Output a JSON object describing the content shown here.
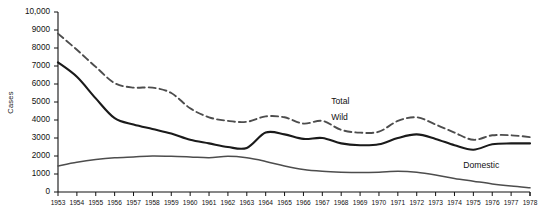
{
  "chart_data": {
    "type": "line",
    "title": "",
    "xlabel": "",
    "ylabel": "Cases",
    "xlim": [
      1953,
      1978
    ],
    "ylim": [
      0,
      10000
    ],
    "grid": false,
    "legend_position": "inline-annotations",
    "y_ticks": [
      "0",
      "1000",
      "2000",
      "3000",
      "4000",
      "5000",
      "6000",
      "7000",
      "8000",
      "9000",
      "10,000"
    ],
    "y_tick_values": [
      0,
      1000,
      2000,
      3000,
      4000,
      5000,
      6000,
      7000,
      8000,
      9000,
      10000
    ],
    "x": [
      1953,
      1954,
      1955,
      1956,
      1957,
      1958,
      1959,
      1960,
      1961,
      1962,
      1963,
      1964,
      1965,
      1966,
      1967,
      1968,
      1969,
      1970,
      1971,
      1972,
      1973,
      1974,
      1975,
      1976,
      1977,
      1978
    ],
    "x_tick_labels": [
      "1953",
      "1954",
      "1955",
      "1956",
      "1957",
      "1958",
      "1959",
      "1960",
      "1961",
      "1962",
      "1963",
      "1964",
      "1965",
      "1966",
      "1967",
      "1968",
      "1969",
      "1970",
      "1971",
      "1972",
      "1973",
      "1974",
      "1975",
      "1976",
      "1977",
      "1978"
    ],
    "series": [
      {
        "name": "Total",
        "style": "dashed",
        "color": "#4d4d4d",
        "values": [
          8800,
          7900,
          6950,
          6050,
          5800,
          5800,
          5500,
          4650,
          4150,
          3950,
          3900,
          4200,
          4150,
          3800,
          3950,
          3450,
          3300,
          3350,
          3950,
          4150,
          3750,
          3300,
          2900,
          3150,
          3150,
          3050
        ]
      },
      {
        "name": "Wild",
        "style": "solid-thick",
        "color": "#1a1a1a",
        "values": [
          7200,
          6400,
          5200,
          4100,
          3750,
          3500,
          3250,
          2900,
          2700,
          2500,
          2450,
          3300,
          3200,
          2950,
          3000,
          2700,
          2600,
          2650,
          3000,
          3200,
          2950,
          2600,
          2350,
          2650,
          2700,
          2700
        ]
      },
      {
        "name": "Domestic",
        "style": "solid-thin",
        "color": "#4d4d4d",
        "values": [
          1450,
          1650,
          1800,
          1900,
          1950,
          2000,
          1980,
          1950,
          1900,
          1980,
          1900,
          1700,
          1450,
          1250,
          1150,
          1100,
          1080,
          1100,
          1150,
          1100,
          950,
          750,
          600,
          450,
          330,
          230
        ]
      }
    ],
    "annotations": [
      {
        "text": "Total",
        "x": 1968,
        "y": 5000
      },
      {
        "text": "Wild",
        "x": 1968,
        "y": 4100
      },
      {
        "text": "Domestic",
        "x": 1975,
        "y": 1450
      }
    ]
  }
}
